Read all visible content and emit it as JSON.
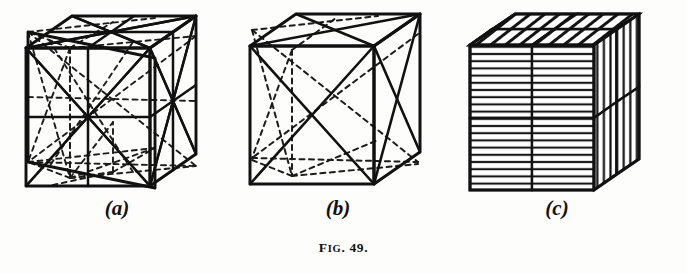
{
  "figure": {
    "caption_prefix": "F",
    "caption_smallcaps": "IG",
    "caption_number": ". 49.",
    "caption_full": "FIG. 49.",
    "background_color": "#fdfdfc",
    "ink_color": "#111111",
    "page_width": 687,
    "page_height": 273
  },
  "panels": [
    {
      "id": "a",
      "label": "(a)",
      "description": "cube with face diagonals and edge-midpoint midlines, hidden edges dashed",
      "line_style": "solid-and-dashed"
    },
    {
      "id": "b",
      "label": "(b)",
      "description": "cube with face diagonals only, hidden edges dashed",
      "line_style": "solid-and-dashed"
    },
    {
      "id": "c",
      "label": "(c)",
      "description": "cube divided into quadrants with directional hatching on each face",
      "line_style": "solid-hatched"
    }
  ],
  "hatching": {
    "front_face": "horizontal",
    "right_face": "vertical",
    "top_face": "diagonal"
  }
}
